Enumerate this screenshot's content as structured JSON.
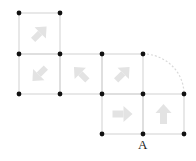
{
  "diagram": {
    "grid": {
      "xs": [
        19,
        60,
        102,
        143,
        184
      ],
      "ys": [
        13,
        54,
        94,
        134
      ],
      "line_color": "#d9d9d9",
      "dot_color": "#111111",
      "arrow_color": "#e0e0e0"
    },
    "cells": [
      {
        "col": 0,
        "row": 0,
        "arrow": "up-right"
      },
      {
        "col": 0,
        "row": 1,
        "arrow": "down-left"
      },
      {
        "col": 1,
        "row": 1,
        "arrow": "up-left"
      },
      {
        "col": 2,
        "row": 1,
        "arrow": "up-right"
      },
      {
        "col": 2,
        "row": 2,
        "arrow": "right"
      },
      {
        "col": 3,
        "row": 2,
        "arrow": "up"
      }
    ],
    "arc": {
      "from": [
        143,
        54
      ],
      "to": [
        184,
        94
      ],
      "style": "dashed"
    },
    "point_label": {
      "text": "A",
      "x": 143,
      "y": 134
    }
  }
}
